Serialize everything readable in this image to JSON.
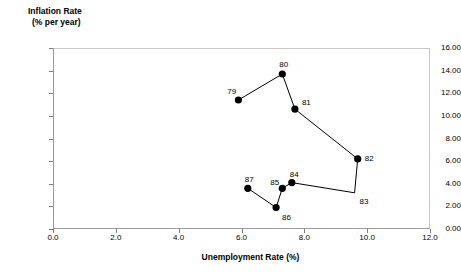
{
  "chart_data": {
    "type": "scatter",
    "title": "",
    "xlabel": "Unemployment Rate (%)",
    "ylabel_line1": "Inflation Rate",
    "ylabel_line2": "(% per year)",
    "xlim": [
      0.0,
      12.0
    ],
    "ylim": [
      0.0,
      16.0
    ],
    "grid": false,
    "legend": "none",
    "connected": true,
    "xticks": [
      "0.0",
      "2.0",
      "4.0",
      "6.0",
      "8.0",
      "10.0",
      "12.0"
    ],
    "xtick_values": [
      0.0,
      2.0,
      4.0,
      6.0,
      8.0,
      10.0,
      12.0
    ],
    "yticks": [
      "0.00",
      "2.00",
      "4.00",
      "6.00",
      "8.00",
      "10.00",
      "12.00",
      "14.00",
      "16.00"
    ],
    "ytick_values": [
      0.0,
      2.0,
      4.0,
      6.0,
      8.0,
      10.0,
      12.0,
      14.0,
      16.0
    ],
    "marker_color": "#000000",
    "line_color": "#000000",
    "points": [
      {
        "label": "79",
        "x": 5.9,
        "y": 11.4,
        "label_dx": -11,
        "label_dy": -12,
        "marker": true
      },
      {
        "label": "80",
        "x": 7.3,
        "y": 13.7,
        "label_dx": -3,
        "label_dy": -13,
        "marker": true
      },
      {
        "label": "81",
        "x": 7.7,
        "y": 10.6,
        "label_dx": 7,
        "label_dy": -10,
        "marker": true
      },
      {
        "label": "82",
        "x": 9.7,
        "y": 6.2,
        "label_dx": 7,
        "label_dy": -4,
        "marker": true
      },
      {
        "label": "83",
        "x": 9.6,
        "y": 3.2,
        "label_dx": 5,
        "label_dy": 5,
        "marker": false
      },
      {
        "label": "84",
        "x": 7.6,
        "y": 4.1,
        "label_dx": -2,
        "label_dy": -12,
        "marker": true
      },
      {
        "label": "85",
        "x": 7.3,
        "y": 3.6,
        "label_dx": -12,
        "label_dy": -9,
        "marker": true
      },
      {
        "label": "86",
        "x": 7.1,
        "y": 1.9,
        "label_dx": 6,
        "label_dy": 6,
        "marker": true
      },
      {
        "label": "87",
        "x": 6.2,
        "y": 3.6,
        "label_dx": -3,
        "label_dy": -12,
        "marker": true
      }
    ]
  }
}
